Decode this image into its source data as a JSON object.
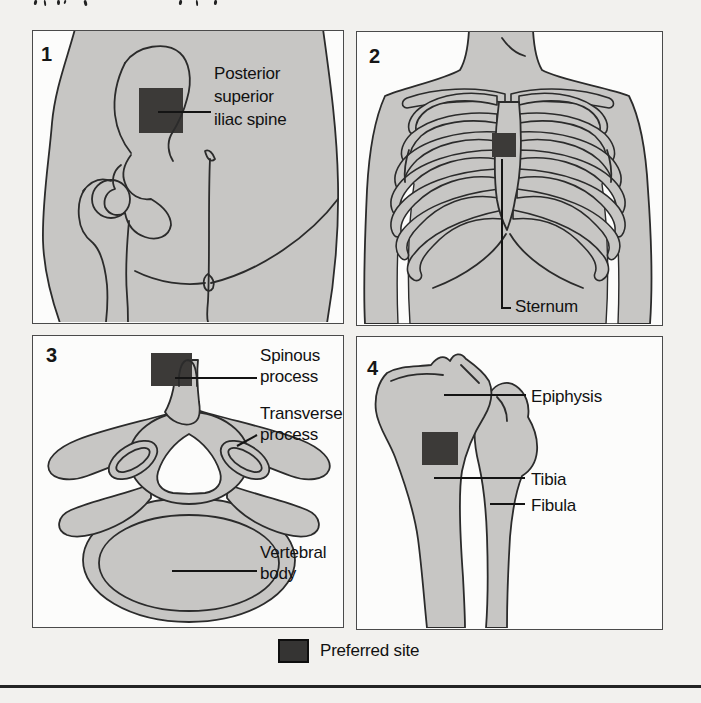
{
  "panels": [
    {
      "number": "1",
      "psis": {
        "lines": [
          "Posterior",
          "superior",
          "iliac spine"
        ]
      }
    },
    {
      "number": "2",
      "sternum": {
        "lines": [
          "Sternum"
        ]
      }
    },
    {
      "number": "3",
      "spinous": {
        "lines": [
          "Spinous",
          "process"
        ]
      },
      "transverse": {
        "lines": [
          "Transverse",
          "process"
        ]
      },
      "vertebral": {
        "lines": [
          "Vertebral",
          "body"
        ]
      }
    },
    {
      "number": "4",
      "epiphysis": {
        "lines": [
          "Epiphysis"
        ]
      },
      "tibia": {
        "lines": [
          "Tibia"
        ]
      },
      "fibula": {
        "lines": [
          "Fibula"
        ]
      }
    }
  ],
  "legend": {
    "label": "Preferred site"
  },
  "colors": {
    "page_background": "#f2f1ee",
    "panel_border": "#4a4a4a",
    "body_fill": "#c7c6c4",
    "outline": "#2b2b2b",
    "preferred_site_fill": "#3c3a38",
    "legend_swatch": "#353433",
    "rule": "#242424"
  }
}
